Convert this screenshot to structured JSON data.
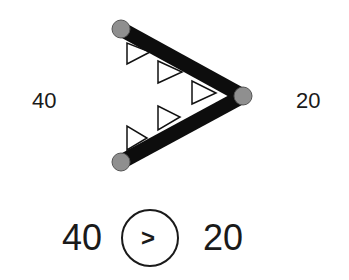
{
  "diagram": {
    "left_label": "40",
    "right_label": "20",
    "comparison": {
      "left_value": "40",
      "operator_symbol": ">",
      "right_value": "20"
    },
    "colors": {
      "line": "#0d0d0d",
      "node_fill": "#8f8f8f",
      "node_stroke": "#555555",
      "triangle_stroke": "#111111",
      "text": "#1a1a1a"
    },
    "nodes": [
      {
        "name": "top-left-node",
        "x": 121,
        "y": 29
      },
      {
        "name": "bottom-left-node",
        "x": 121,
        "y": 162
      },
      {
        "name": "right-vertex-node",
        "x": 243,
        "y": 96
      }
    ]
  }
}
